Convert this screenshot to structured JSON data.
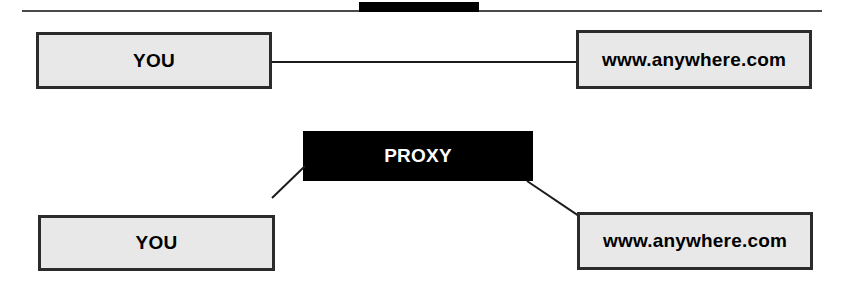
{
  "figure": {
    "title": "Direct connection versus proxied connection",
    "background_color": "#ffffff",
    "box_fill_color": "#e8e8e8",
    "box_border_color": "#2b2b2b",
    "proxy_fill_color": "#000000",
    "proxy_text_color": "#ffffff",
    "line_color": "#1c1c1c"
  },
  "top_rule": {
    "label": "page-rule"
  },
  "diagrams": [
    {
      "name": "direct-connection",
      "nodes": [
        {
          "id": "you-direct",
          "label": "YOU",
          "style": "light"
        },
        {
          "id": "site-direct",
          "label": "www.anywhere.com",
          "style": "light"
        }
      ],
      "links": [
        {
          "id": "direct",
          "from": "you-direct",
          "to": "site-direct",
          "shape": "straight"
        }
      ]
    },
    {
      "name": "proxied-connection",
      "nodes": [
        {
          "id": "proxy",
          "label": "PROXY",
          "style": "dark"
        },
        {
          "id": "you-proxy",
          "label": "YOU",
          "style": "light"
        },
        {
          "id": "site-proxy",
          "label": "www.anywhere.com",
          "style": "light"
        }
      ],
      "links": [
        {
          "id": "proxy-left",
          "from": "you-proxy",
          "to": "proxy",
          "shape": "diagonal"
        },
        {
          "id": "proxy-right",
          "from": "proxy",
          "to": "site-proxy",
          "shape": "diagonal"
        }
      ]
    }
  ]
}
